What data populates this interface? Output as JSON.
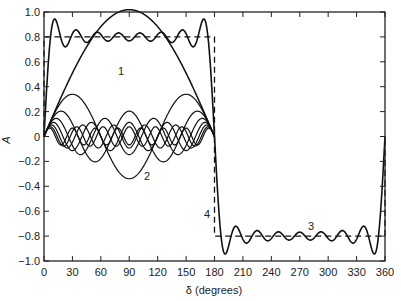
{
  "chart_data": {
    "type": "line",
    "title": "",
    "xlabel": "δ (degrees)",
    "ylabel": "A",
    "xlim": [
      0,
      360
    ],
    "ylim": [
      -1.0,
      1.0
    ],
    "grid": false,
    "legend": "none (curves labeled inline 1–4)",
    "x_ticks": [
      "0",
      "30",
      "60",
      "90",
      "120",
      "150",
      "180",
      "210",
      "240",
      "270",
      "300",
      "330",
      "360"
    ],
    "y_ticks": [
      "1.0",
      "0.8",
      "0.6",
      "0.4",
      "0.2",
      "0",
      "−0.2",
      "−0.4",
      "−0.6",
      "−0.8",
      "−1.0"
    ],
    "square_wave_amplitude": 0.8,
    "series": [
      {
        "name": "1",
        "description": "fundamental harmonic, sin δ, peak ≈1.0 at 90°",
        "style": "solid",
        "x": [
          0,
          30,
          60,
          90,
          120,
          150,
          180
        ],
        "values": [
          0,
          0.51,
          0.88,
          1.02,
          0.88,
          0.51,
          0
        ]
      },
      {
        "name": "2",
        "description": "third harmonic, dips to ≈−0.33 at 90°",
        "style": "solid",
        "x": [
          0,
          30,
          60,
          90,
          120,
          150,
          180
        ],
        "values": [
          0,
          0.34,
          0,
          -0.34,
          0,
          0.34,
          0
        ]
      },
      {
        "name": "higher harmonics",
        "description": "5th–15th harmonic components, amplitudes ≈0.2 to 0.07 over 0–180°",
        "style": "solid"
      },
      {
        "name": "3",
        "description": "sum of harmonics (Fourier approximation), oscillates about ±0.8 with Gibbs overshoot ≈±0.9",
        "style": "solid",
        "x": [
          0,
          10,
          90,
          180,
          190,
          270,
          350,
          360
        ],
        "values": [
          0,
          0.9,
          0.8,
          0,
          -0.9,
          -0.8,
          -0.9,
          0
        ]
      },
      {
        "name": "4",
        "description": "ideal square wave",
        "style": "dashed",
        "x": [
          0,
          0,
          180,
          180,
          360,
          360
        ],
        "values": [
          0,
          0.8,
          0.8,
          -0.8,
          -0.8,
          0
        ]
      }
    ],
    "annotations": [
      {
        "text": "1",
        "x": 78,
        "y": 0.52
      },
      {
        "text": "2",
        "x": 102,
        "y": -0.34
      },
      {
        "text": "3",
        "x": 282,
        "y": -0.74
      },
      {
        "text": "4",
        "x": 173,
        "y": -0.62
      }
    ]
  },
  "labels": {
    "xlabel": "δ (degrees)",
    "ylabel": "A",
    "curve1": "1",
    "curve2": "2",
    "curve3": "3",
    "curve4": "4"
  }
}
